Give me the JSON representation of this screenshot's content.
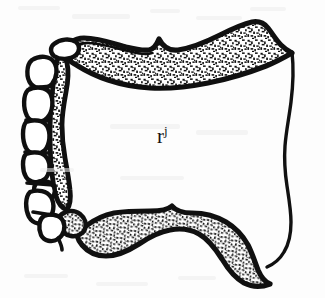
{
  "figure": {
    "kind": "scientific-line-drawing",
    "background_color": "#fdfdfd",
    "ink_color": "#111111",
    "stipple_color": "#1a1a1a",
    "label": {
      "base": "r",
      "superscript": "j",
      "full_text": "rj"
    },
    "regions": [
      {
        "name": "top-stippled-band",
        "texture": "stipple",
        "position": "upper edge"
      },
      {
        "name": "bottom-stippled-band",
        "texture": "stipple",
        "position": "lower edge"
      },
      {
        "name": "left-cell-chain",
        "texture": "outlined-polygons",
        "position": "left flank",
        "cell_count": 9
      },
      {
        "name": "right-edge-line",
        "texture": "thin-line",
        "position": "right side"
      },
      {
        "name": "interior-cavity",
        "texture": "blank",
        "position": "center"
      }
    ]
  }
}
